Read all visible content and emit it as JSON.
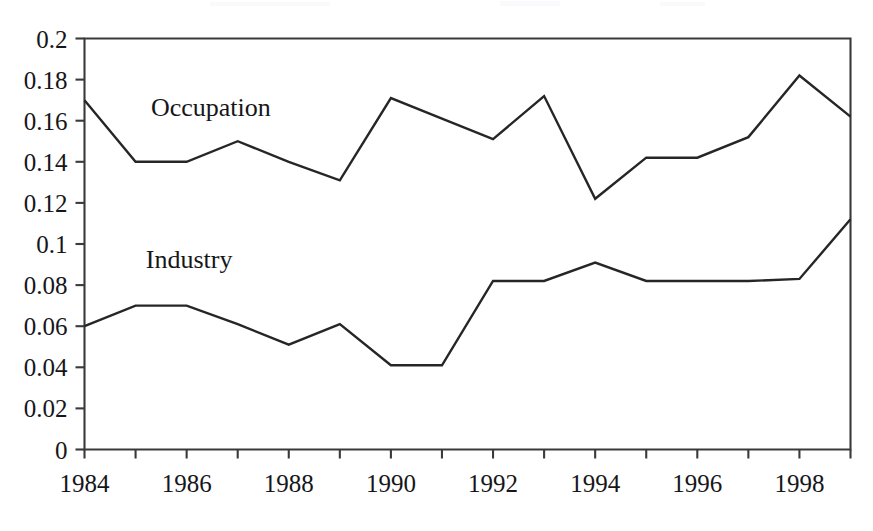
{
  "chart_data": {
    "type": "line",
    "title": "",
    "subtitle": "",
    "xlabel": "",
    "ylabel": "",
    "x": [
      1984,
      1985,
      1986,
      1987,
      1988,
      1989,
      1990,
      1991,
      1992,
      1993,
      1994,
      1995,
      1996,
      1997,
      1998,
      1999
    ],
    "xlim": [
      1984,
      1999
    ],
    "ylim": [
      0,
      0.2
    ],
    "grid": false,
    "legend_position": "inline-annotation",
    "x_tick_labels": [
      "1984",
      "1986",
      "1988",
      "1990",
      "1992",
      "1994",
      "1996",
      "1998"
    ],
    "x_tick_values": [
      1984,
      1986,
      1988,
      1990,
      1992,
      1994,
      1996,
      1998
    ],
    "x_minor_tick_values": [
      1985,
      1987,
      1989,
      1991,
      1993,
      1995,
      1997,
      1999
    ],
    "y_tick_labels": [
      "0",
      "0.02",
      "0.04",
      "0.06",
      "0.08",
      "0.1",
      "0.12",
      "0.14",
      "0.16",
      "0.18",
      "0.2"
    ],
    "y_tick_values": [
      0,
      0.02,
      0.04,
      0.06,
      0.08,
      0.1,
      0.12,
      0.14,
      0.16,
      0.18,
      0.2
    ],
    "series": [
      {
        "name": "Occupation",
        "label": "Occupation",
        "color": "#262628",
        "label_x": 1985.3,
        "label_y": 0.1625,
        "values": [
          0.17,
          0.14,
          0.14,
          0.15,
          0.14,
          0.131,
          0.171,
          0.161,
          0.151,
          0.172,
          0.122,
          0.142,
          0.142,
          0.152,
          0.182,
          0.162
        ]
      },
      {
        "name": "Industry",
        "label": "Industry",
        "color": "#262628",
        "label_x": 1985.2,
        "label_y": 0.0885,
        "values": [
          0.06,
          0.07,
          0.07,
          0.061,
          0.051,
          0.061,
          0.041,
          0.041,
          0.082,
          0.082,
          0.091,
          0.082,
          0.082,
          0.082,
          0.083,
          0.112
        ]
      }
    ]
  },
  "plot_frame": {
    "border_color": "#3a3a3c",
    "background": "#ffffff"
  }
}
